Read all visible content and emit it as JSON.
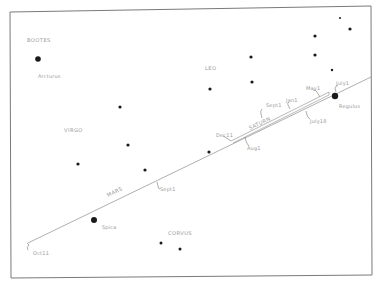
{
  "diagram": {
    "frame": {
      "tl": [
        10,
        12
      ],
      "tr": [
        371,
        6
      ],
      "br": [
        372,
        275
      ],
      "bl": [
        11,
        278
      ]
    },
    "ecliptic": {
      "start": [
        28,
        243
      ],
      "end": [
        371,
        77
      ]
    },
    "constellations": [
      {
        "name": "BOOTES",
        "x": 27,
        "y": 42
      },
      {
        "name": "LEO",
        "x": 205,
        "y": 70
      },
      {
        "name": "VIRGO",
        "x": 64,
        "y": 132
      },
      {
        "name": "CORVUS",
        "x": 168,
        "y": 235
      }
    ],
    "named_stars": [
      {
        "name": "Arcturus",
        "x": 38,
        "y": 59,
        "r": 2.8,
        "label_x": 38,
        "label_y": 78
      },
      {
        "name": "Regulus",
        "x": 335,
        "y": 96,
        "r": 3.2,
        "label_x": 339,
        "label_y": 108
      },
      {
        "name": "Spica",
        "x": 94,
        "y": 220,
        "r": 3.0,
        "label_x": 102,
        "label_y": 229
      }
    ],
    "stars": [
      {
        "x": 340,
        "y": 18,
        "r": 1.0
      },
      {
        "x": 350,
        "y": 29,
        "r": 1.6
      },
      {
        "x": 315,
        "y": 36,
        "r": 1.6
      },
      {
        "x": 315,
        "y": 55,
        "r": 1.6
      },
      {
        "x": 332,
        "y": 70,
        "r": 1.2
      },
      {
        "x": 251,
        "y": 57,
        "r": 1.6
      },
      {
        "x": 252,
        "y": 82,
        "r": 1.6
      },
      {
        "x": 210,
        "y": 89,
        "r": 1.6
      },
      {
        "x": 120,
        "y": 107,
        "r": 1.6
      },
      {
        "x": 128,
        "y": 145,
        "r": 1.6
      },
      {
        "x": 78,
        "y": 164,
        "r": 1.6
      },
      {
        "x": 145,
        "y": 170,
        "r": 1.6
      },
      {
        "x": 209,
        "y": 152,
        "r": 1.6
      },
      {
        "x": 161,
        "y": 243,
        "r": 1.5
      },
      {
        "x": 180,
        "y": 249,
        "r": 1.5
      }
    ],
    "planets": [
      {
        "name": "MARS",
        "x": 108,
        "y": 197,
        "angle": -26
      },
      {
        "name": "SATURN",
        "x": 250,
        "y": 130,
        "angle": -26
      }
    ],
    "dates": [
      {
        "label": "Oct11",
        "x": 33,
        "y": 255
      },
      {
        "label": "Sept1",
        "x": 160,
        "y": 191
      },
      {
        "label": "Dec11",
        "x": 216,
        "y": 137
      },
      {
        "label": "Aug1",
        "x": 247,
        "y": 150
      },
      {
        "label": "Sept1",
        "x": 266,
        "y": 107
      },
      {
        "label": "Jan1",
        "x": 286,
        "y": 102
      },
      {
        "label": "May1",
        "x": 306,
        "y": 90
      },
      {
        "label": "July1",
        "x": 336,
        "y": 85
      },
      {
        "label": "July18",
        "x": 310,
        "y": 123
      }
    ]
  }
}
